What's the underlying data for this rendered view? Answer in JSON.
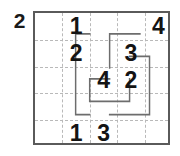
{
  "puzzle": {
    "type": "numberlink-grid",
    "outside_label": "2",
    "grid": {
      "columns": 5,
      "rows": 5,
      "border_color": "#5a5a5a",
      "gridline_color": "#b9b9b9",
      "background": "#ffffff"
    },
    "digit_color": "#141414",
    "path_color": "#6d6d6d",
    "cells": [
      {
        "name": "cell-r1c2",
        "row": 1,
        "col": 2,
        "value": "1"
      },
      {
        "name": "cell-r1c5",
        "row": 1,
        "col": 5,
        "value": "4"
      },
      {
        "name": "cell-r2c2",
        "row": 2,
        "col": 2,
        "value": "2"
      },
      {
        "name": "cell-r2c4",
        "row": 2,
        "col": 4,
        "value": "3"
      },
      {
        "name": "cell-r3c3",
        "row": 3,
        "col": 3,
        "value": "4"
      },
      {
        "name": "cell-r3c4",
        "row": 3,
        "col": 4,
        "value": "2"
      },
      {
        "name": "cell-r5c2",
        "row": 5,
        "col": 2,
        "value": "1"
      },
      {
        "name": "cell-r5c3",
        "row": 5,
        "col": 3,
        "value": "3"
      }
    ],
    "paths": [
      {
        "name": "path-left-loop",
        "d": "M 74 25 L 55 25 L 55 122 L 74 122"
      },
      {
        "name": "path-top-right",
        "d": "M 142 25 L 101 25 L 101 66"
      },
      {
        "name": "path-center-u",
        "d": "M 101 79 L 74 79 L 74 106 L 128 106 L 128 79"
      },
      {
        "name": "path-right-down",
        "d": "M 128 52 L 155 52 L 155 122 L 101 122"
      }
    ]
  }
}
